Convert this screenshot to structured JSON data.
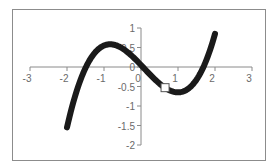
{
  "chart_data": {
    "type": "line",
    "title": "",
    "xlabel": "",
    "ylabel": "",
    "xlim": [
      -3,
      3
    ],
    "ylim": [
      -2,
      1
    ],
    "grid": false,
    "legend": null,
    "x_ticks": [
      -3,
      -2,
      -1,
      0,
      1,
      2,
      3
    ],
    "x_tick_labels": [
      "-3",
      "-2",
      "-1",
      "0",
      "1",
      "2",
      "3"
    ],
    "y_ticks": [
      1,
      0.5,
      0,
      -0.5,
      -1,
      -1.5,
      -2
    ],
    "y_tick_labels": [
      "1",
      "0.5",
      "0",
      "-0.5",
      "-1",
      "-1.5",
      "-2"
    ],
    "series": [
      {
        "name": "curve",
        "function_fit": "y = 0.4x^3 - 0.1x^2 - x + 0.05",
        "x_range": [
          -2,
          2
        ],
        "color": "#1a1a1a",
        "line_width": "thick",
        "x": [
          -2.0,
          -1.8,
          -1.6,
          -1.4,
          -1.2,
          -1.0,
          -0.8,
          -0.6,
          -0.4,
          -0.2,
          0.0,
          0.2,
          0.4,
          0.6,
          0.8,
          1.0,
          1.2,
          1.4,
          1.6,
          1.8,
          2.0
        ],
        "y": [
          -1.55,
          -0.98,
          -0.54,
          -0.21,
          0.02,
          0.15,
          0.58,
          0.53,
          0.41,
          0.24,
          0.05,
          -0.15,
          -0.34,
          -0.5,
          -0.61,
          -0.65,
          -0.61,
          -0.45,
          -0.17,
          0.26,
          0.85
        ]
      }
    ],
    "markers": [
      {
        "x": 0.65,
        "y": -0.53,
        "shape": "square",
        "fill": "#ffffff",
        "stroke": "#555555"
      }
    ]
  }
}
